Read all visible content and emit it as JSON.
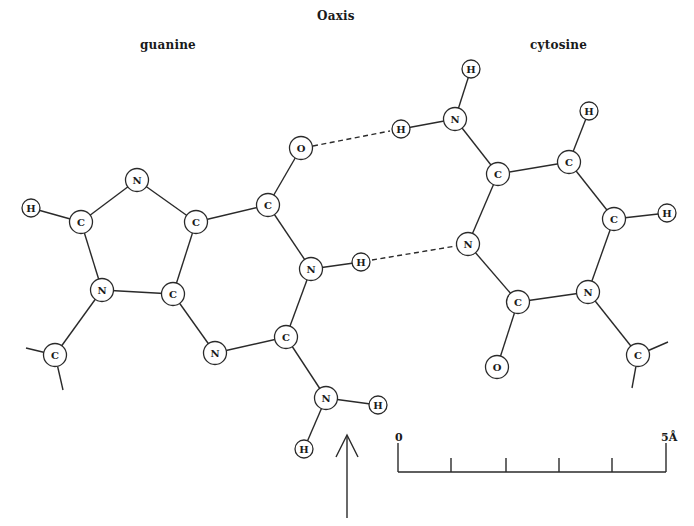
{
  "labels": {
    "axis": "Oaxis",
    "guanine": "guanine",
    "cytosine": "cytosine"
  },
  "scale_bar": {
    "start_label": "0",
    "end_label": "5Å",
    "ticks": 5
  },
  "colors": {
    "ink": "#2a2a2a",
    "background": "#ffffff"
  },
  "molecules": {
    "guanine": {
      "atoms": [
        {
          "id": "g_h8",
          "el": "H",
          "x": 31,
          "y": 208
        },
        {
          "id": "g_c8",
          "el": "C",
          "x": 81,
          "y": 222
        },
        {
          "id": "g_n7",
          "el": "N",
          "x": 137,
          "y": 180
        },
        {
          "id": "g_c5",
          "el": "C",
          "x": 196,
          "y": 222
        },
        {
          "id": "g_c6",
          "el": "C",
          "x": 268,
          "y": 205
        },
        {
          "id": "g_o6",
          "el": "O",
          "x": 301,
          "y": 148
        },
        {
          "id": "g_n9",
          "el": "N",
          "x": 102,
          "y": 290
        },
        {
          "id": "g_c4",
          "el": "C",
          "x": 173,
          "y": 294
        },
        {
          "id": "g_n1",
          "el": "N",
          "x": 311,
          "y": 269
        },
        {
          "id": "g_h1",
          "el": "H",
          "x": 361,
          "y": 262
        },
        {
          "id": "g_n3",
          "el": "N",
          "x": 215,
          "y": 353
        },
        {
          "id": "g_c2",
          "el": "C",
          "x": 286,
          "y": 337
        },
        {
          "id": "g_n2",
          "el": "N",
          "x": 326,
          "y": 398
        },
        {
          "id": "g_h2a",
          "el": "H",
          "x": 378,
          "y": 405
        },
        {
          "id": "g_h2b",
          "el": "H",
          "x": 304,
          "y": 449
        },
        {
          "id": "g_c1p",
          "el": "C",
          "x": 55,
          "y": 355
        }
      ]
    },
    "cytosine": {
      "atoms": [
        {
          "id": "c_h4a",
          "el": "H",
          "x": 471,
          "y": 69
        },
        {
          "id": "c_n4",
          "el": "N",
          "x": 455,
          "y": 119
        },
        {
          "id": "c_h4b",
          "el": "H",
          "x": 401,
          "y": 129
        },
        {
          "id": "c_c4",
          "el": "C",
          "x": 498,
          "y": 174
        },
        {
          "id": "c_c5",
          "el": "C",
          "x": 569,
          "y": 162
        },
        {
          "id": "c_h5",
          "el": "H",
          "x": 589,
          "y": 111
        },
        {
          "id": "c_c6",
          "el": "C",
          "x": 614,
          "y": 219
        },
        {
          "id": "c_h6",
          "el": "H",
          "x": 667,
          "y": 213
        },
        {
          "id": "c_n3",
          "el": "N",
          "x": 468,
          "y": 244
        },
        {
          "id": "c_c2",
          "el": "C",
          "x": 518,
          "y": 302
        },
        {
          "id": "c_n1",
          "el": "N",
          "x": 588,
          "y": 292
        },
        {
          "id": "c_o2",
          "el": "O",
          "x": 497,
          "y": 367
        },
        {
          "id": "c_c1p",
          "el": "C",
          "x": 638,
          "y": 355
        }
      ]
    }
  }
}
